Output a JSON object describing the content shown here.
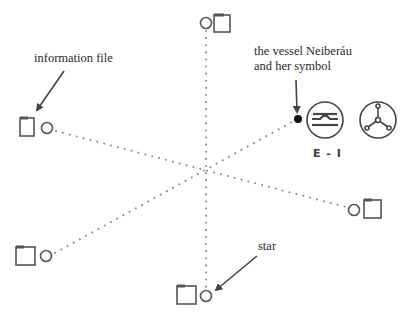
{
  "diagram": {
    "labels": {
      "information_file": "information file",
      "vessel_line1": "the vessel Neiberáu",
      "vessel_line2": "and her symbol",
      "star": "star",
      "symbol_code": "E - I"
    },
    "colors": {
      "line": "#555555",
      "dots": "#888888",
      "vessel_dot": "#111111",
      "text": "#2a2a2a"
    },
    "center": [
      206,
      165
    ],
    "nodes": [
      {
        "id": "top",
        "circle": [
          206,
          23
        ],
        "square": [
          214,
          14
        ]
      },
      {
        "id": "left",
        "circle": [
          47,
          128
        ],
        "square": [
          19,
          117
        ]
      },
      {
        "id": "right",
        "circle": [
          354,
          210
        ],
        "square": [
          363,
          199
        ]
      },
      {
        "id": "bottom-left",
        "circle": [
          47,
          256
        ],
        "square": [
          16,
          246
        ]
      },
      {
        "id": "bottom",
        "circle": [
          206,
          296
        ],
        "square": [
          177,
          285
        ]
      }
    ],
    "vessel": {
      "dot": [
        298,
        119
      ]
    }
  }
}
